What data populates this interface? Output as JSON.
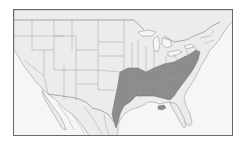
{
  "map": {
    "type": "range-map",
    "region": "United States and northern Mexico",
    "highlighted_region": "Eastern and southeastern United States",
    "colors": {
      "land": "#ececec",
      "ocean": "#f6f6f6",
      "range": "#8c8c8c",
      "borders": "#7a7a7a",
      "frame": "#6a6a6a"
    }
  }
}
